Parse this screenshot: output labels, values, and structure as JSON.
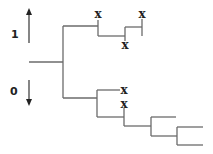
{
  "diagram": {
    "type": "binary-tree",
    "axis": {
      "up_label": "1",
      "down_label": "0",
      "up_arrow": {
        "x": 29,
        "y1": 43,
        "y2": 8
      },
      "down_arrow": {
        "x": 29,
        "y1": 80,
        "y2": 106
      }
    },
    "marker_glyph": "x",
    "colors": {
      "branch": "#6b6b6b",
      "text": "#222222",
      "background": "#ffffff"
    },
    "segments": [
      {
        "id": "root-stem",
        "x1": 29,
        "y1": 62,
        "x2": 63,
        "y2": 62
      },
      {
        "id": "root-split",
        "x1": 63,
        "y1": 26,
        "x2": 63,
        "y2": 98
      },
      {
        "id": "upper-branch",
        "x1": 63,
        "y1": 26,
        "x2": 98,
        "y2": 26
      },
      {
        "id": "lower-branch",
        "x1": 63,
        "y1": 98,
        "x2": 97,
        "y2": 98
      },
      {
        "id": "upper-node-down",
        "x1": 98,
        "y1": 20,
        "x2": 98,
        "y2": 36
      },
      {
        "id": "upper-node-right",
        "x1": 98,
        "y1": 36,
        "x2": 125,
        "y2": 36
      },
      {
        "id": "upper-sub-split",
        "x1": 125,
        "y1": 27,
        "x2": 125,
        "y2": 41
      },
      {
        "id": "upper-sub-top",
        "x1": 125,
        "y1": 27,
        "x2": 142,
        "y2": 27
      },
      {
        "id": "upper-sub-top-vertical",
        "x1": 142,
        "y1": 19,
        "x2": 142,
        "y2": 36
      },
      {
        "id": "lower-split",
        "x1": 97,
        "y1": 90,
        "x2": 97,
        "y2": 117
      },
      {
        "id": "lower-top",
        "x1": 97,
        "y1": 90,
        "x2": 120,
        "y2": 90
      },
      {
        "id": "lower-bottom",
        "x1": 97,
        "y1": 117,
        "x2": 124,
        "y2": 117
      },
      {
        "id": "lower-node-vertical",
        "x1": 124,
        "y1": 108,
        "x2": 124,
        "y2": 126
      },
      {
        "id": "lower-node-right",
        "x1": 124,
        "y1": 126,
        "x2": 151,
        "y2": 126
      },
      {
        "id": "deep-split-1",
        "x1": 151,
        "y1": 117,
        "x2": 151,
        "y2": 136
      },
      {
        "id": "deep-top-1",
        "x1": 151,
        "y1": 117,
        "x2": 176,
        "y2": 117
      },
      {
        "id": "deep-bottom-1",
        "x1": 151,
        "y1": 136,
        "x2": 177,
        "y2": 136
      },
      {
        "id": "deep-split-2",
        "x1": 177,
        "y1": 127,
        "x2": 177,
        "y2": 145
      },
      {
        "id": "deep-top-2",
        "x1": 177,
        "y1": 127,
        "x2": 203,
        "y2": 127
      },
      {
        "id": "deep-bottom-2",
        "x1": 177,
        "y1": 145,
        "x2": 203,
        "y2": 145
      }
    ],
    "markers": [
      {
        "id": "x-upper-left",
        "label": "x",
        "x": 98,
        "y": 18
      },
      {
        "id": "x-upper-right",
        "label": "x",
        "x": 142,
        "y": 18
      },
      {
        "id": "x-upper-mid",
        "label": "x",
        "x": 125,
        "y": 49
      },
      {
        "id": "x-lower-top",
        "label": "x",
        "x": 124,
        "y": 94
      },
      {
        "id": "x-lower-mid",
        "label": "x",
        "x": 124,
        "y": 108
      }
    ]
  }
}
